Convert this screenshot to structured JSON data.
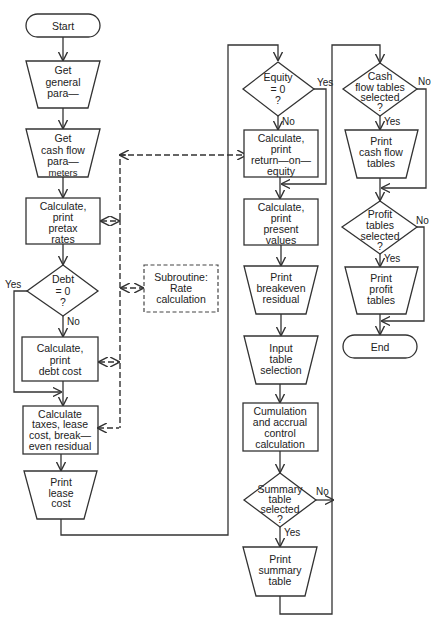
{
  "nodes": {
    "start": [
      "Start"
    ],
    "get_general": [
      "Get",
      "general",
      "para—",
      "meters"
    ],
    "get_cashflow": [
      "Get",
      "cash flow",
      "para—",
      "meters"
    ],
    "pretax": [
      "Calculate,",
      "print",
      "pretax",
      "rates"
    ],
    "debt_decision": [
      "Debt",
      "= 0",
      "?"
    ],
    "debt_cost": [
      "Calculate,",
      "print",
      "debt cost"
    ],
    "taxes": [
      "Calculate",
      "taxes, lease",
      "cost, break—",
      "even residual"
    ],
    "print_lease": [
      "Print",
      "lease",
      "cost"
    ],
    "subroutine": [
      "Subroutine:",
      "Rate",
      "calculation"
    ],
    "equity_decision": [
      "Equity",
      "= 0",
      "?"
    ],
    "roe": [
      "Calculate,",
      "print",
      "return—on—",
      "equity"
    ],
    "present_values": [
      "Calculate,",
      "print",
      "present",
      "values"
    ],
    "breakeven": [
      "Print",
      "breakeven",
      "residual"
    ],
    "input_selection": [
      "Input",
      "table",
      "selection"
    ],
    "cumulation": [
      "Cumulation",
      "and accrual",
      "control",
      "calculation"
    ],
    "summary_decision": [
      "Summary",
      "table",
      "selected",
      "?"
    ],
    "print_summary": [
      "Print",
      "summary",
      "table"
    ],
    "cashflow_decision": [
      "Cash",
      "flow tables",
      "selected",
      "?"
    ],
    "print_cashflow": [
      "Print",
      "cash flow",
      "tables"
    ],
    "profit_decision": [
      "Profit",
      "tables",
      "selected",
      "?"
    ],
    "print_profit": [
      "Print",
      "profit",
      "tables"
    ],
    "end": [
      "End"
    ]
  },
  "labels": {
    "yes": "Yes",
    "no": "No"
  }
}
